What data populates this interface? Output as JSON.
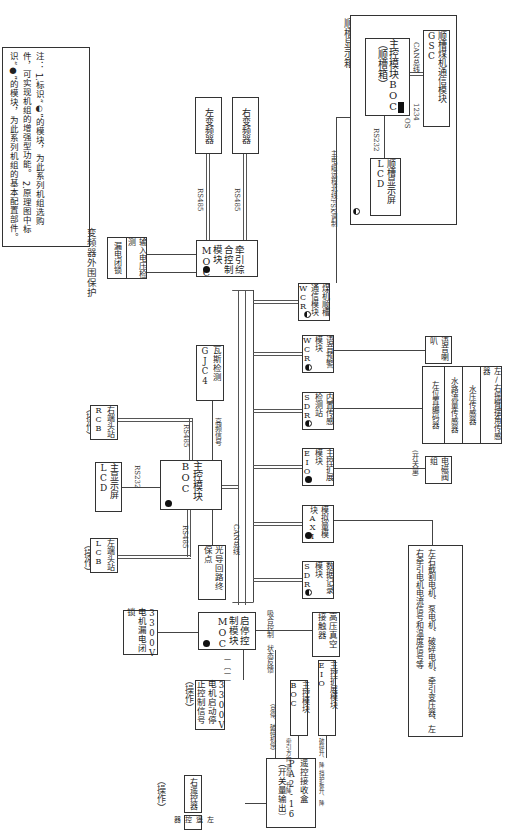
{
  "note": {
    "title": "注：",
    "line1": "1.标识“◐”的模块，为此系列机组选购件，可实现机组的增强型功能。",
    "line2": "2.原理图中标识“●”的模块，为此系列机组的基本配置部件。"
  },
  "trough_display_box": {
    "title": "顺槽显示箱",
    "boc": "主控模块BOC（顺槽箱）",
    "lcd": "顺槽显示屏LCD",
    "gsc": "顺槽煤机通信模块GSC",
    "rs232": "RS232",
    "can": "CAN总线",
    "os": "OS",
    "dip": "1234",
    "link_label": "主电缆远程北线FSK调制"
  },
  "inverter_protect": {
    "title": "变频器外围保护",
    "input_voltage": "输入电压检测",
    "leak_lock": "漏电闭锁"
  },
  "inverters": {
    "left": "左变频器",
    "right": "右变频器",
    "rs485_a": "RS485",
    "rs485_b": "RS485"
  },
  "traction_moc": "牵引综合控制模块MOC",
  "modules": [
    {
      "name": "煤机顺槽通信模块WCR",
      "mark": "optional"
    },
    {
      "name": "语音预警模块WCR",
      "mark": "optional"
    },
    {
      "name": "内置传感检测站SDR",
      "mark": "optional"
    },
    {
      "name": "主控扩展模块EIO",
      "mark": "basic"
    },
    {
      "name": "模拟量模块AXI",
      "mark": "basic"
    },
    {
      "name": "数据记录模块SDR",
      "mark": "optional"
    }
  ],
  "peripherals": {
    "speaker": "语音喇叭",
    "sensors": [
      "左/右摇臂摆角传感器",
      "水压传感器",
      "水路流量传感器",
      "左位置编码器"
    ],
    "valve": "电磁阀组",
    "switch_label": "(开关量)",
    "analog_note": "左右截割电机、泵电机、破碎电机、牵引变压器、左右牵引电机电流信号和温度信号等"
  },
  "boc_main": {
    "name": "主控模块BOC",
    "lcd": "主显示屏LCD",
    "rs232": "RS232",
    "rs485_top": "RS485",
    "rs485_bottom": "RS485",
    "freq_signal": "高频信号",
    "gas": "瓦斯检测GJC4",
    "rcb": "右端头站RCB",
    "lcb": "左端头站LCB",
    "op1": "（操作）",
    "op2": "（操作）",
    "can_label": "CAN总线",
    "fiber": "光导回路终保点"
  },
  "start_moc": {
    "name": "启停控制模块MOC",
    "leak": "3300V电机漏电闭锁",
    "ctrl": "3300V电机启动停止控制信号",
    "op": "（操作）",
    "dash": "一〔一一",
    "hv": "高压真空接触器",
    "feedback": "状态反馈",
    "close": "吸合控制"
  },
  "remote": {
    "receiver": "遥控接收盒PA2-16（开关量输出）",
    "left": "左遥控器",
    "right": "右遥控器",
    "op": "（操作）",
    "to_moc": "（总停、破碎机停）",
    "to_boc_label": "牵引方向 调高、升降",
    "boc": "主控模块BOC",
    "to_eio_label": "破碎升、降 挡护板升、降",
    "eio": "主控扩展模块EIO"
  }
}
